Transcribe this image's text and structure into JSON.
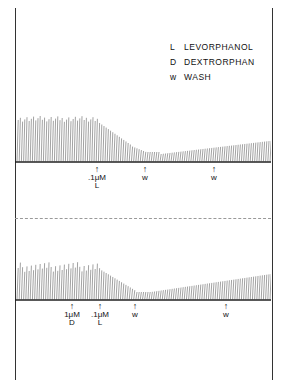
{
  "legend": [
    {
      "key": "L",
      "label": "LEVORPHANOL"
    },
    {
      "key": "D",
      "label": "DEXTRORPHAN"
    },
    {
      "key": "w",
      "label": "WASH"
    }
  ],
  "panel_top": {
    "markers": [
      {
        "x": 97,
        "dose": ".1μM",
        "drug": "L"
      },
      {
        "x": 145,
        "dose": "w",
        "drug": ""
      },
      {
        "x": 214,
        "dose": "w",
        "drug": ""
      }
    ]
  },
  "panel_bottom": {
    "markers": [
      {
        "x": 72,
        "dose": "1μM",
        "drug": "D"
      },
      {
        "x": 100,
        "dose": ".1μM",
        "drug": "L"
      },
      {
        "x": 135,
        "dose": "w",
        "drug": ""
      },
      {
        "x": 226,
        "dose": "w",
        "drug": ""
      }
    ]
  }
}
